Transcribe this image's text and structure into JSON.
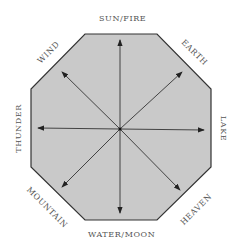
{
  "diagram": {
    "colors": {
      "fill": "#c9c9c9",
      "stroke": "#333333",
      "text": "#555555"
    },
    "labels": {
      "top": "SUN/FIRE",
      "top_right": "EARTH",
      "right": "LAKE",
      "bottom_right": "HEAVEN",
      "bottom": "WATER/MOON",
      "bottom_left": "MOUNTAIN",
      "left": "THUNDER",
      "top_left": "WIND"
    }
  }
}
